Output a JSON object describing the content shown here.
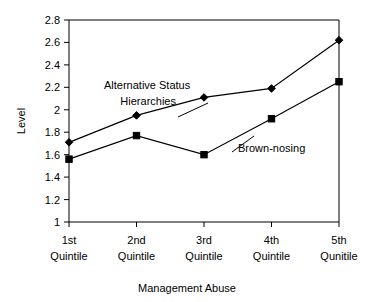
{
  "chart_data": {
    "type": "line",
    "title": "",
    "xlabel": "Management Abuse",
    "ylabel": "Level",
    "categories": [
      "1st Quintile",
      "2nd Quintile",
      "3rd Quintile",
      "4th Quintile",
      "5th Qunitile"
    ],
    "category_lines": [
      {
        "top": "1st",
        "bottom": "Quintile"
      },
      {
        "top": "2nd",
        "bottom": "Quintile"
      },
      {
        "top": "3rd",
        "bottom": "Quintile"
      },
      {
        "top": "4th",
        "bottom": "Quintile"
      },
      {
        "top": "5th",
        "bottom": "Qunitile"
      }
    ],
    "ylim": [
      1,
      2.8
    ],
    "ytick_labels": [
      "1",
      "1.2",
      "1.4",
      "1.6",
      "1.8",
      "2",
      "2.2",
      "2.4",
      "2.6",
      "2.8"
    ],
    "ytick_values": [
      1,
      1.2,
      1.4,
      1.6,
      1.8,
      2,
      2.2,
      2.4,
      2.6,
      2.8
    ],
    "grid": false,
    "legend_position": "inline-annotation",
    "series": [
      {
        "name": "Alternative Status Hierarchies",
        "marker": "diamond",
        "color": "#000000",
        "values": [
          1.71,
          1.95,
          2.11,
          2.19,
          2.62
        ],
        "annotation_lines": [
          "Alternative Status",
          "Hierarchies"
        ]
      },
      {
        "name": "Brown-nosing",
        "marker": "square",
        "color": "#000000",
        "values": [
          1.56,
          1.77,
          1.6,
          1.92,
          2.25
        ],
        "annotation_lines": [
          "Brown-nosing"
        ]
      }
    ]
  },
  "axis": {
    "y_title": "Level",
    "x_title": "Management Abuse"
  },
  "annotations": {
    "series1_line1": "Alternative Status",
    "series1_line2": "Hierarchies",
    "series2_line1": "Brown-nosing"
  },
  "yticks": {
    "t0": "1",
    "t1": "1.2",
    "t2": "1.4",
    "t3": "1.6",
    "t4": "1.8",
    "t5": "2",
    "t6": "2.2",
    "t7": "2.4",
    "t8": "2.6",
    "t9": "2.8"
  },
  "xticks": {
    "c0_top": "1st",
    "c0_bottom": "Quintile",
    "c1_top": "2nd",
    "c1_bottom": "Quintile",
    "c2_top": "3rd",
    "c2_bottom": "Quintile",
    "c3_top": "4th",
    "c3_bottom": "Quintile",
    "c4_top": "5th",
    "c4_bottom": "Qunitile"
  }
}
